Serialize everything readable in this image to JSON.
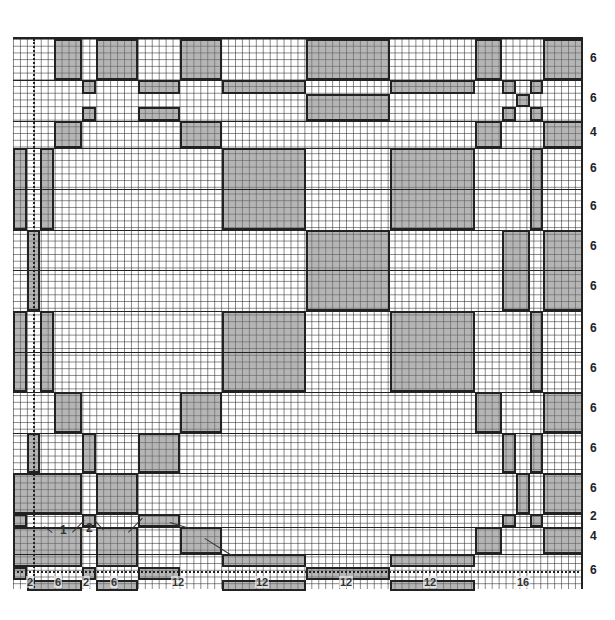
{
  "diagram": {
    "type": "woven plaid grid chart",
    "grid": {
      "cols": 82,
      "rows": 82
    },
    "row_labels": [
      {
        "label": "6",
        "y": 58
      },
      {
        "label": "6",
        "y": 98
      },
      {
        "label": "4",
        "y": 132
      },
      {
        "label": "6",
        "y": 168
      },
      {
        "label": "6",
        "y": 206
      },
      {
        "label": "6",
        "y": 246
      },
      {
        "label": "6",
        "y": 286
      },
      {
        "label": "6",
        "y": 328
      },
      {
        "label": "6",
        "y": 368
      },
      {
        "label": "6",
        "y": 408
      },
      {
        "label": "6",
        "y": 448
      },
      {
        "label": "6",
        "y": 488
      },
      {
        "label": "2",
        "y": 516
      },
      {
        "label": "4",
        "y": 536
      },
      {
        "label": "6",
        "y": 570
      }
    ],
    "col_labels": [
      {
        "label": "2",
        "x": 30
      },
      {
        "label": "6",
        "x": 58
      },
      {
        "label": "2",
        "x": 86
      },
      {
        "label": "6",
        "x": 114
      },
      {
        "label": "12",
        "x": 175
      },
      {
        "label": "12",
        "x": 259
      },
      {
        "label": "12",
        "x": 343
      },
      {
        "label": "12",
        "x": 427
      },
      {
        "label": "16",
        "x": 520
      }
    ],
    "annotations": [
      {
        "label": "1",
        "x": 60,
        "y": 530
      },
      {
        "label": "2",
        "x": 86,
        "y": 528
      }
    ],
    "colors": {
      "shade": "#9a9a9a",
      "line": "#222222",
      "grid": "#555555"
    }
  }
}
